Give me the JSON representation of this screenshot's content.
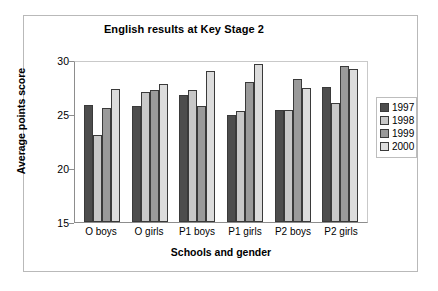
{
  "chart_data": {
    "type": "bar",
    "title": "English results at Key Stage 2",
    "xlabel": "Schools and gender",
    "ylabel": "Average points score",
    "categories": [
      "O boys",
      "O girls",
      "P1 boys",
      "P1 girls",
      "P2 boys",
      "P2 girls"
    ],
    "series": [
      {
        "name": "1997",
        "color": "#4d4d4d",
        "values": [
          25.8,
          25.7,
          26.8,
          24.9,
          25.4,
          27.5
        ]
      },
      {
        "name": "1998",
        "color": "#c8c8c8",
        "values": [
          23.1,
          27.0,
          27.2,
          25.3,
          25.4,
          26.0
        ]
      },
      {
        "name": "1999",
        "color": "#9a9a9a",
        "values": [
          25.6,
          27.2,
          25.7,
          28.0,
          28.2,
          29.4
        ]
      },
      {
        "name": "2000",
        "color": "#dcdcdc",
        "values": [
          27.3,
          27.8,
          29.0,
          29.6,
          27.4,
          29.2
        ]
      }
    ],
    "ylim": [
      15,
      30
    ],
    "yticks": [
      15,
      20,
      25,
      30
    ],
    "ytick_labels": [
      "15",
      "20",
      "25",
      "30"
    ],
    "grid": false,
    "legend_position": "right"
  }
}
